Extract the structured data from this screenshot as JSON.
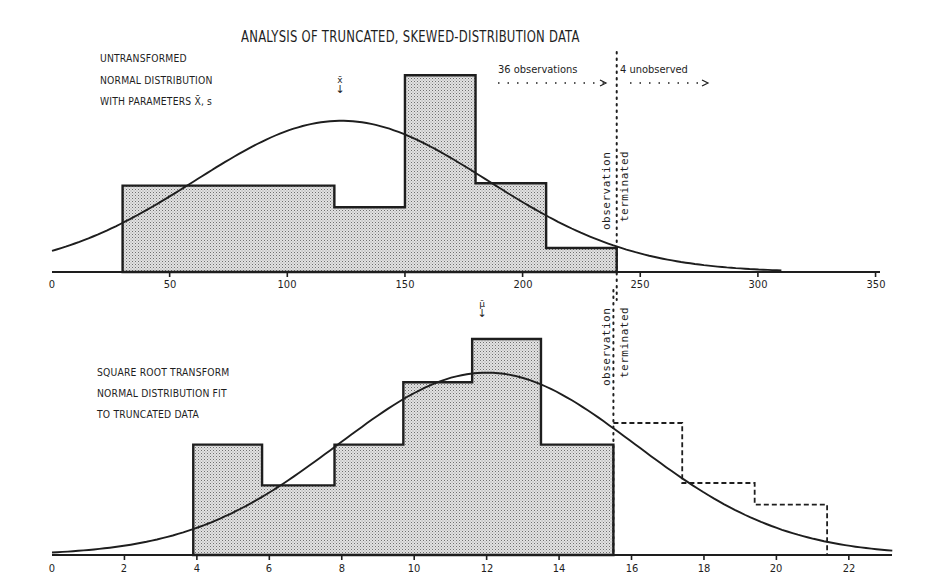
{
  "title": "ANALYSIS OF TRUNCATED, SKEWED-DISTRIBUTION DATA",
  "colors": {
    "ink": "#1e1e1e",
    "fill": "#c9c9c9",
    "background": "#ffffff"
  },
  "top_panel": {
    "notes": [
      "UNTRANSFORMED",
      "NORMAL DISTRIBUTION",
      "WITH PARAMETERS X̄, s"
    ],
    "mean_marker": "x̄",
    "observed_label": "36 observations",
    "unobserved_label": "4 unobserved",
    "cutoff_label_1": "observation",
    "cutoff_label_2": "terminated",
    "x_ticks": [
      "0",
      "50",
      "100",
      "150",
      "200",
      "250",
      "300",
      "350"
    ]
  },
  "bottom_panel": {
    "notes": [
      "SQUARE ROOT TRANSFORM",
      "NORMAL DISTRIBUTION FIT",
      "TO TRUNCATED DATA"
    ],
    "mean_marker": "μ̄",
    "cutoff_label_1": "observation",
    "cutoff_label_2": "terminated",
    "x_ticks": [
      "0",
      "2",
      "4",
      "6",
      "8",
      "10",
      "12",
      "14",
      "16",
      "18",
      "20",
      "22"
    ]
  },
  "chart_data": [
    {
      "type": "bar",
      "title": "UNTRANSFORMED — NORMAL DISTRIBUTION WITH PARAMETERS X̄, s",
      "xlabel": "",
      "ylabel": "",
      "xlim": [
        0,
        360
      ],
      "x_ticks": [
        0,
        50,
        100,
        150,
        200,
        250,
        300,
        350
      ],
      "histogram": {
        "bin_edges": [
          30,
          120,
          150,
          180,
          210,
          240
        ],
        "relative_heights": [
          3.6,
          2.7,
          8.2,
          3.7,
          1.0
        ],
        "style": "solid, stippled fill"
      },
      "curve": {
        "type": "normal",
        "mean": 123,
        "peak_relative_height": 6.3,
        "x_range": [
          0,
          310
        ]
      },
      "cutoff_x": 240,
      "annotations": [
        "x̄ arrow at ~123",
        "36 observations",
        "4 unobserved",
        "observation terminated"
      ],
      "grid": false
    },
    {
      "type": "bar",
      "title": "SQUARE ROOT TRANSFORM — NORMAL DISTRIBUTION FIT TO TRUNCATED DATA",
      "xlabel": "",
      "ylabel": "",
      "xlim": [
        0,
        23.2
      ],
      "x_ticks": [
        0,
        2,
        4,
        6,
        8,
        10,
        12,
        14,
        16,
        18,
        20,
        22
      ],
      "histogram": {
        "bin_edges": [
          3.9,
          5.8,
          7.8,
          9.7,
          11.6,
          13.5,
          15.5
        ],
        "relative_heights": [
          4.6,
          2.9,
          4.6,
          7.2,
          9.0,
          4.6
        ],
        "style": "solid, stippled fill"
      },
      "projected_unobserved_bins": {
        "bin_edges": [
          15.5,
          17.4,
          19.4,
          21.4
        ],
        "relative_heights": [
          5.5,
          3.0,
          2.1
        ],
        "style": "dashed outline"
      },
      "curve": {
        "type": "normal",
        "mean": 12.0,
        "peak_relative_height": 7.6,
        "x_range": [
          0,
          23.2
        ]
      },
      "cutoff_x": 15.5,
      "annotations": [
        "μ arrow at ~12",
        "observation terminated"
      ],
      "grid": false
    }
  ]
}
